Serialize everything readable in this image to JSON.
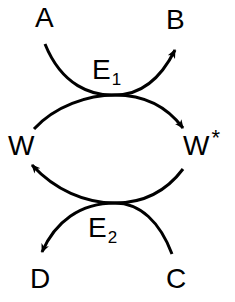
{
  "diagram": {
    "type": "coupled-reaction-cycle",
    "nodes": {
      "A": {
        "label": "A"
      },
      "B": {
        "label": "B"
      },
      "C": {
        "label": "C"
      },
      "D": {
        "label": "D"
      },
      "W": {
        "label": "W"
      },
      "W_star": {
        "label": "W",
        "superscript": "*"
      }
    },
    "enzymes": {
      "E1": {
        "label": "E",
        "subscript": "1"
      },
      "E2": {
        "label": "E",
        "subscript": "2"
      }
    },
    "edges": [
      {
        "from": "A",
        "to": "B",
        "via": "E1"
      },
      {
        "from": "W",
        "to": "W*",
        "via": "E1"
      },
      {
        "from": "W*",
        "to": "W",
        "via": "E2"
      },
      {
        "from": "C",
        "to": "D",
        "via": "E2"
      }
    ],
    "colors": {
      "stroke": "#000000",
      "background": "#ffffff"
    }
  }
}
